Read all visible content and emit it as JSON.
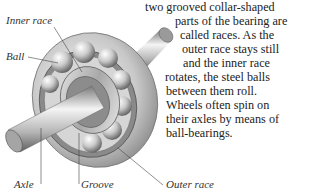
{
  "labels": {
    "inner_race": "Inner race",
    "ball": "Ball",
    "axle": "Axle",
    "groove": "Groove",
    "outer_race": "Outer race"
  },
  "text_lines": [
    "two grooved collar-shaped",
    "parts of the bearing are",
    "called races. As the",
    "outer race stays still",
    "and the inner race",
    "rotates, the steel balls",
    "between them roll.",
    "Wheels often spin on",
    "their axles by means of",
    "ball-bearings."
  ],
  "colors": {
    "metal_light": "#f2f2f2",
    "metal_mid": "#bdbdbd",
    "metal_dark": "#6e6e6e",
    "leader_line": "#444444"
  }
}
